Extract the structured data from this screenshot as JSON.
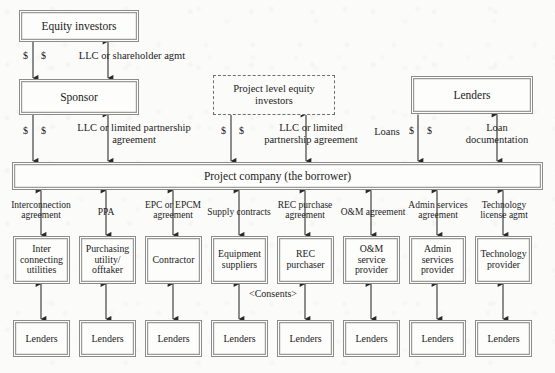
{
  "diagram": {
    "background_color": "#fbfbfa",
    "box_border_color": "#8c8c8c",
    "text_color": "#1b1b1b"
  },
  "top_nodes": {
    "equity_investors": "Equity investors",
    "sponsor": "Sponsor",
    "project_level_equity_investors": "Project level equity\ninvestors",
    "lenders_top": "Lenders",
    "project_company": "Project company (the borrower)"
  },
  "top_edge_labels": {
    "equity_to_sponsor_money": "$",
    "equity_to_sponsor_money2": "$",
    "llc_or_shareholder_agmt": "LLC or shareholder agmt",
    "sponsor_to_project_money": "$",
    "sponsor_to_project_money2": "$",
    "llc_or_limited_partnership_agreement": "LLC or limited partnership\nagreement",
    "ple_money": "$",
    "ple_money2": "$",
    "ple_llc_agreement": "LLC or limited\npartnership agreement",
    "loans": "Loans",
    "loans_money": "$",
    "loans_money2": "$",
    "loan_documentation": "Loan\ndocumentation"
  },
  "contract_labels": [
    "Interconnection\nagreement",
    "PPA",
    "EPC or EPCM\nagreement",
    "Supply contracts",
    "REC purchase\nagreement",
    "O&M agreement",
    "Admin services\nagreement",
    "Technology\nlicense agmt"
  ],
  "counterparties": [
    "Inter\nconnecting\nutilities",
    "Purchasing\nutility/\nofftaker",
    "Contractor",
    "Equipment\nsuppliers",
    "REC\npurchaser",
    "O&M\nservice\nprovider",
    "Admin\nservices\nprovider",
    "Technology\nprovider"
  ],
  "consents_label": "<Consents>",
  "bottom_lenders": [
    "Lenders",
    "Lenders",
    "Lenders",
    "Lenders",
    "Lenders",
    "Lenders",
    "Lenders",
    "Lenders"
  ]
}
